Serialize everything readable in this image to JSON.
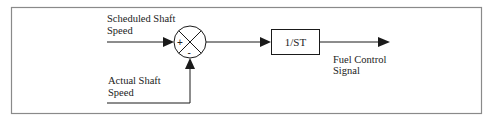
{
  "diagram": {
    "type": "control-block-diagram",
    "inputs": {
      "reference": {
        "label_line1": "Scheduled Shaft",
        "label_line2": "Speed"
      },
      "feedback": {
        "label_line1": "Actual Shaft",
        "label_line2": "Speed"
      }
    },
    "summing_junction": {
      "plus_sign": "+",
      "minus_sign": "-"
    },
    "block": {
      "label": "1/ST"
    },
    "output": {
      "label_line1": "Fuel Control",
      "label_line2": "Signal"
    },
    "colors": {
      "line": "#1a1a1a",
      "frame": "#8a8a8a",
      "text": "#222222"
    }
  }
}
